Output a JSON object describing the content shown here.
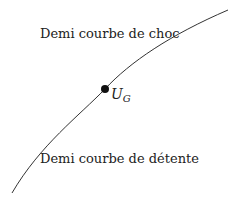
{
  "diagram": {
    "labels": {
      "shock": "Demi courbe de choc",
      "rarefaction": "Demi courbe de détente",
      "point_main": "U",
      "point_sub": "G"
    },
    "colors": {
      "curve": "#333333",
      "point": "#111111",
      "text": "#222222"
    }
  }
}
